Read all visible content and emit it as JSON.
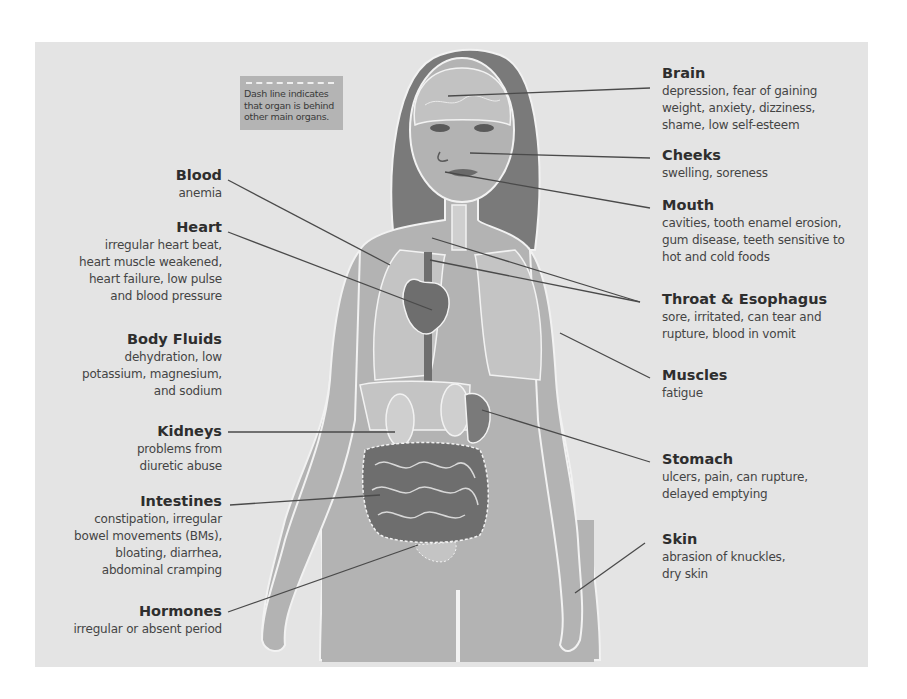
{
  "legend": {
    "text": "Dash line indicates that organ is behind other main organs."
  },
  "colors": {
    "panel": "#e4e4e4",
    "body": "#b3b3b3",
    "hair": "#7a7a7a",
    "organ_dark": "#6e6e6e",
    "organ_light": "#c9c9c9",
    "outline": "#f2f2f2",
    "leader": "#4a4a4a"
  },
  "left_labels": [
    {
      "title": "Blood",
      "desc": [
        "anemia"
      ]
    },
    {
      "title": "Heart",
      "desc": [
        "irregular heart beat,",
        "heart muscle weakened,",
        "heart failure, low pulse",
        "and blood pressure"
      ]
    },
    {
      "title": "Body Fluids",
      "desc": [
        "dehydration, low",
        "potassium, magnesium,",
        "and sodium"
      ]
    },
    {
      "title": "Kidneys",
      "desc": [
        "problems from",
        "diuretic abuse"
      ]
    },
    {
      "title": "Intestines",
      "desc": [
        "constipation, irregular",
        "bowel movements (BMs),",
        "bloating, diarrhea,",
        "abdominal cramping"
      ]
    },
    {
      "title": "Hormones",
      "desc": [
        "irregular or absent period"
      ]
    }
  ],
  "right_labels": [
    {
      "title": "Brain",
      "desc": [
        "depression, fear of gaining",
        "weight, anxiety, dizziness,",
        "shame, low self-esteem"
      ]
    },
    {
      "title": "Cheeks",
      "desc": [
        "swelling, soreness"
      ]
    },
    {
      "title": "Mouth",
      "desc": [
        "cavities, tooth enamel erosion,",
        "gum disease, teeth sensitive to",
        "hot and cold foods"
      ]
    },
    {
      "title": "Throat & Esophagus",
      "desc": [
        "sore, irritated, can tear and",
        "rupture, blood in vomit"
      ]
    },
    {
      "title": "Muscles",
      "desc": [
        "fatigue"
      ]
    },
    {
      "title": "Stomach",
      "desc": [
        "ulcers, pain, can rupture,",
        "delayed emptying"
      ]
    },
    {
      "title": "Skin",
      "desc": [
        "abrasion of knuckles,",
        "dry skin"
      ]
    }
  ]
}
